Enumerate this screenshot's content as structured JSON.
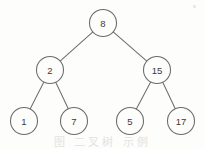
{
  "figure": {
    "caption_partial": "图 二叉树 示例",
    "background_color": "#fdfdfc",
    "stroke_color": "#6b6b6b",
    "label_color": "#3a3a3a"
  },
  "chart_data": {
    "type": "diagram",
    "diagram_kind": "binary-tree",
    "node_radius": 13.5,
    "nodes": [
      {
        "id": "n8",
        "label": "8",
        "x": 103,
        "y": 23,
        "level": 0,
        "role": "root"
      },
      {
        "id": "n2",
        "label": "2",
        "x": 50,
        "y": 70,
        "level": 1,
        "role": "internal"
      },
      {
        "id": "n15",
        "label": "15",
        "x": 157,
        "y": 70,
        "level": 1,
        "role": "internal"
      },
      {
        "id": "n1",
        "label": "1",
        "x": 24,
        "y": 121,
        "level": 2,
        "role": "leaf"
      },
      {
        "id": "n7",
        "label": "7",
        "x": 74,
        "y": 121,
        "level": 2,
        "role": "leaf"
      },
      {
        "id": "n5",
        "label": "5",
        "x": 130,
        "y": 121,
        "level": 2,
        "role": "leaf"
      },
      {
        "id": "n17",
        "label": "17",
        "x": 181,
        "y": 121,
        "level": 2,
        "role": "leaf"
      }
    ],
    "edges": [
      {
        "from": "n8",
        "to": "n2",
        "side": "left"
      },
      {
        "from": "n8",
        "to": "n15",
        "side": "right"
      },
      {
        "from": "n2",
        "to": "n1",
        "side": "left"
      },
      {
        "from": "n2",
        "to": "n7",
        "side": "right"
      },
      {
        "from": "n15",
        "to": "n5",
        "side": "left"
      },
      {
        "from": "n15",
        "to": "n17",
        "side": "right"
      }
    ]
  }
}
